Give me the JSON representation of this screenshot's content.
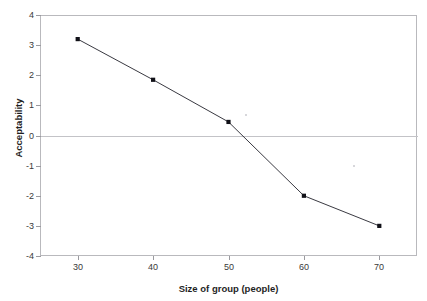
{
  "chart_data": {
    "type": "line",
    "title": "",
    "xlabel": "Size of group (people)",
    "ylabel": "Acceptability",
    "x": [
      30,
      40,
      50,
      60,
      70
    ],
    "values": [
      3.2,
      1.85,
      0.45,
      -2.0,
      -3.0
    ],
    "series": [
      {
        "name": "Acceptability",
        "values": [
          3.2,
          1.85,
          0.45,
          -2.0,
          -3.0
        ]
      }
    ],
    "xlim": [
      25,
      75
    ],
    "ylim": [
      -4,
      4
    ],
    "xticks": [
      30,
      40,
      50,
      60,
      70
    ],
    "yticks": [
      4,
      3,
      2,
      1,
      0,
      -1,
      -2,
      -3,
      -4
    ],
    "xtick_labels": [
      "30",
      "40",
      "50",
      "60",
      "70"
    ],
    "ytick_labels": [
      "4",
      "3",
      "2",
      "1",
      "0",
      "-1",
      "-2",
      "-3",
      "-4"
    ],
    "grid": false,
    "zero_line": true,
    "legend": null,
    "legend_position": "none",
    "marker": "square",
    "line_color": "#23232b",
    "marker_color": "#111118",
    "frame_color": "#b9b9bd",
    "zero_line_color": "#c3c3c7",
    "background": "#ffffff"
  },
  "axes": {
    "y_title": "Acceptability",
    "x_title": "Size of group (people)"
  },
  "page_bleed": {
    "text": ""
  }
}
